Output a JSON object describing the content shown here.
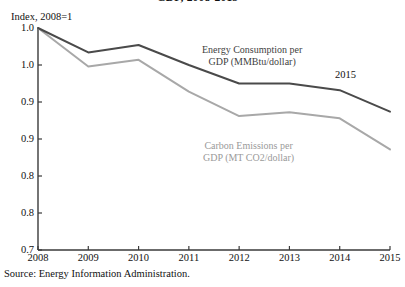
{
  "title": "GDP, 2008-2015",
  "y_axis_caption": "Index, 2008=1",
  "source_note": "Source: Energy Information Administration.",
  "end_year_annotation": "2015",
  "annotations": {
    "energy": {
      "line1": "Energy Consumption per",
      "line2": "GDP (MMBtu/dollar)"
    },
    "carbon": {
      "line1": "Carbon Emissions per",
      "line2": "GDP (MT CO2/dollar)"
    }
  },
  "colors": {
    "energy_line": "#4a4a4a",
    "carbon_line": "#a8a8a8",
    "axis": "#3a3a3a",
    "text": "#111111"
  },
  "chart_data": {
    "type": "line",
    "title": "GDP, 2008-2015",
    "xlabel": "",
    "ylabel": "Index, 2008=1",
    "grid": false,
    "legend_position": "inline-annotations",
    "categories": [
      "2008",
      "2009",
      "2010",
      "2011",
      "2012",
      "2013",
      "2014",
      "2015"
    ],
    "x": [
      2008,
      2009,
      2010,
      2011,
      2012,
      2013,
      2014,
      2015
    ],
    "xlim": [
      2008,
      2015
    ],
    "ylim": [
      0.75,
      1.05
    ],
    "y_ticks": [
      1.05,
      1.0,
      0.95,
      0.9,
      0.85,
      0.8,
      0.75
    ],
    "y_tick_labels": [
      "1.0",
      "1.0",
      "0.9",
      "0.9",
      "0.8",
      "0.8",
      "0.7"
    ],
    "series": [
      {
        "name": "Energy Consumption per GDP (MMBtu/dollar)",
        "color": "#4a4a4a",
        "values": [
          1.05,
          1.017,
          1.027,
          1.0,
          0.975,
          0.975,
          0.966,
          0.937
        ]
      },
      {
        "name": "Carbon Emissions per GDP (MT CO2/dollar)",
        "color": "#a8a8a8",
        "values": [
          1.05,
          0.998,
          1.007,
          0.964,
          0.931,
          0.936,
          0.928,
          0.886
        ]
      }
    ]
  }
}
